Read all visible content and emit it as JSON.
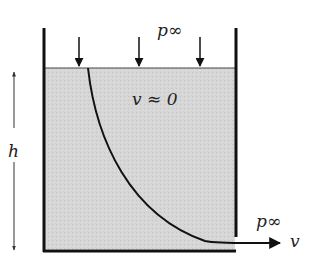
{
  "diagram": {
    "labels": {
      "top_pressure": "p∞",
      "interior_velocity": "v ≈ 0",
      "height": "h",
      "exit_pressure": "p∞",
      "exit_velocity": "v"
    },
    "colors": {
      "fluid": "#d4d4d4",
      "wall": "#111111",
      "line": "#111111"
    }
  }
}
